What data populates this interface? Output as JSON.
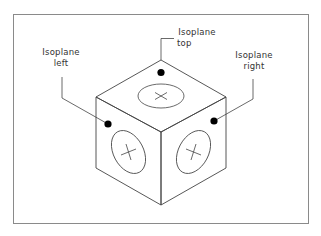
{
  "figure": {
    "background": "#ffffff",
    "frame_color": "#8a8a8a",
    "line_color": "#444444",
    "dot_color": "#000000"
  },
  "labels": {
    "top": {
      "line1": "Isoplane",
      "line2": "top"
    },
    "left": {
      "line1": "Isoplane",
      "line2": "left"
    },
    "right": {
      "line1": "Isoplane",
      "line2": "right"
    }
  },
  "cube": {
    "faces": [
      "top",
      "left",
      "right"
    ],
    "top_face_symbol": "×",
    "side_face_symbol": "+"
  }
}
